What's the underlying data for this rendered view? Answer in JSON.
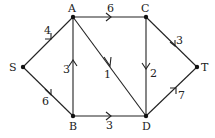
{
  "diagram": {
    "type": "directed-weighted-graph",
    "nodes": [
      {
        "id": "S",
        "label": "S",
        "x": 23,
        "y": 67
      },
      {
        "id": "A",
        "label": "A",
        "x": 73,
        "y": 17
      },
      {
        "id": "C",
        "label": "C",
        "x": 146,
        "y": 17
      },
      {
        "id": "T",
        "label": "T",
        "x": 197,
        "y": 67
      },
      {
        "id": "B",
        "label": "B",
        "x": 73,
        "y": 116
      },
      {
        "id": "D",
        "label": "D",
        "x": 146,
        "y": 116
      }
    ],
    "edges": [
      {
        "from": "S",
        "to": "A",
        "weight": "4"
      },
      {
        "from": "S",
        "to": "B",
        "weight": "6"
      },
      {
        "from": "A",
        "to": "C",
        "weight": "6"
      },
      {
        "from": "A",
        "to": "D",
        "weight": "1"
      },
      {
        "from": "B",
        "to": "A",
        "weight": "3"
      },
      {
        "from": "C",
        "to": "D",
        "weight": "2"
      },
      {
        "from": "C",
        "to": "T",
        "weight": "3"
      },
      {
        "from": "B",
        "to": "D",
        "weight": "3"
      },
      {
        "from": "D",
        "to": "T",
        "weight": "7"
      }
    ]
  }
}
